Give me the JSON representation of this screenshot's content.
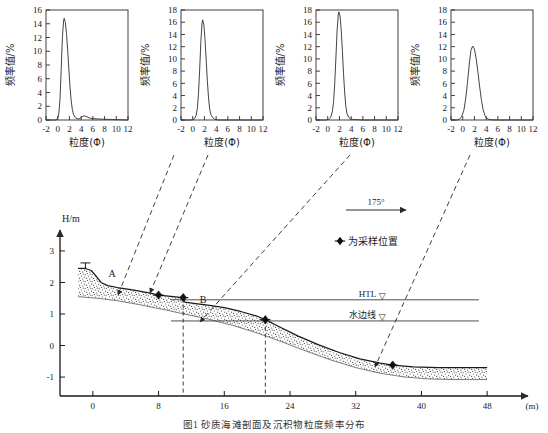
{
  "figure": {
    "caption": "图1  砂质海滩剖面及沉积物粒度频率分布",
    "profile": {
      "yaxis_label": "H/m",
      "xaxis_unit": "(m)",
      "y_ticks": [
        3,
        2,
        1,
        0,
        -1
      ],
      "x_ticks": [
        0,
        8,
        16,
        24,
        32,
        40,
        48
      ],
      "xlim": [
        -4,
        52
      ],
      "ylim": [
        -1.6,
        3.6
      ],
      "point_labels": [
        "A",
        "B"
      ],
      "wind_label": "175°",
      "legend_text": "为采样位置",
      "legend_marker": "diamond-marker",
      "htl_label": "HTL",
      "waterline_label": "水边线",
      "htl_level": 1.45,
      "waterline_level": 0.78,
      "sample_points": [
        {
          "x": 8.0,
          "y": 1.6
        },
        {
          "x": 11.0,
          "y": 1.52
        },
        {
          "x": 21.0,
          "y": 0.82
        },
        {
          "x": 36.5,
          "y": -0.62
        }
      ],
      "surface": [
        [
          -1.8,
          2.45
        ],
        [
          -1.0,
          2.45
        ],
        [
          -0.2,
          2.38
        ],
        [
          0.4,
          2.2
        ],
        [
          1.0,
          2.0
        ],
        [
          1.8,
          1.9
        ],
        [
          3.0,
          1.84
        ],
        [
          5.0,
          1.76
        ],
        [
          7.0,
          1.66
        ],
        [
          8.0,
          1.6
        ],
        [
          9.5,
          1.56
        ],
        [
          10.6,
          1.53
        ],
        [
          11.0,
          1.52
        ],
        [
          11.2,
          1.38
        ],
        [
          12.5,
          1.33
        ],
        [
          14.0,
          1.28
        ],
        [
          16.0,
          1.2
        ],
        [
          18.0,
          1.08
        ],
        [
          20.0,
          0.93
        ],
        [
          21.0,
          0.82
        ],
        [
          22.5,
          0.62
        ],
        [
          25.0,
          0.3
        ],
        [
          27.5,
          0.02
        ],
        [
          30.0,
          -0.22
        ],
        [
          32.5,
          -0.42
        ],
        [
          35.0,
          -0.56
        ],
        [
          36.5,
          -0.62
        ],
        [
          39.0,
          -0.68
        ],
        [
          42.0,
          -0.7
        ],
        [
          45.0,
          -0.7
        ],
        [
          48.0,
          -0.7
        ]
      ],
      "base": [
        [
          -1.8,
          1.55
        ],
        [
          0.5,
          1.5
        ],
        [
          3.0,
          1.42
        ],
        [
          6.0,
          1.28
        ],
        [
          9.0,
          1.12
        ],
        [
          11.5,
          0.98
        ],
        [
          14.0,
          0.84
        ],
        [
          17.0,
          0.64
        ],
        [
          20.0,
          0.4
        ],
        [
          23.0,
          0.12
        ],
        [
          26.0,
          -0.18
        ],
        [
          29.0,
          -0.46
        ],
        [
          32.0,
          -0.7
        ],
        [
          35.0,
          -0.88
        ],
        [
          38.0,
          -1.0
        ],
        [
          41.0,
          -1.06
        ],
        [
          44.0,
          -1.08
        ],
        [
          48.0,
          -1.08
        ]
      ],
      "leaders": [
        {
          "from": [
            174,
            155
          ],
          "to": [
            118,
            295
          ]
        },
        {
          "from": [
            208,
            155
          ],
          "to": [
            150,
            293
          ]
        },
        {
          "from": [
            350,
            155
          ],
          "to": [
            200,
            322
          ]
        },
        {
          "from": [
            470,
            155
          ],
          "to": [
            375,
            367
          ]
        }
      ]
    }
  },
  "chart_data": [
    {
      "type": "line",
      "index": 1,
      "title": "",
      "xlabel": "粒度(Φ)",
      "ylabel": "频率值/%",
      "xlim": [
        -2,
        12
      ],
      "ylim": [
        0,
        16
      ],
      "xticks": [
        -2,
        0,
        2,
        4,
        6,
        8,
        10,
        12
      ],
      "yticks": [
        0,
        2,
        4,
        6,
        8,
        10,
        12,
        14,
        16
      ],
      "peak_x": 1.1,
      "peak_y": 14.8,
      "grid": false,
      "x": [
        -2.0,
        -1.0,
        -0.4,
        0.0,
        0.2,
        0.4,
        0.6,
        0.8,
        1.0,
        1.1,
        1.3,
        1.5,
        1.7,
        1.9,
        2.1,
        2.3,
        2.5,
        2.7,
        3.0,
        3.3,
        3.6,
        4.0,
        4.3,
        4.6,
        5.0,
        5.4,
        6.0,
        7.0,
        8.0,
        9.0,
        10.0,
        11.0,
        12.0
      ],
      "y": [
        0.0,
        0.0,
        0.0,
        0.2,
        1.0,
        3.2,
        7.5,
        12.0,
        14.4,
        14.8,
        14.2,
        12.6,
        10.2,
        7.4,
        4.8,
        2.8,
        1.5,
        0.8,
        0.35,
        0.2,
        0.15,
        0.35,
        0.55,
        0.6,
        0.45,
        0.3,
        0.2,
        0.15,
        0.1,
        0.08,
        0.05,
        0.03,
        0.0
      ]
    },
    {
      "type": "line",
      "index": 2,
      "title": "",
      "xlabel": "粒度(Φ)",
      "ylabel": "频率值/%",
      "xlim": [
        -2,
        12
      ],
      "ylim": [
        0,
        18
      ],
      "xticks": [
        -2,
        0,
        2,
        4,
        6,
        8,
        10,
        12
      ],
      "yticks": [
        0,
        2,
        4,
        6,
        8,
        10,
        12,
        14,
        16,
        18
      ],
      "peak_x": 1.7,
      "peak_y": 16.4,
      "grid": false,
      "x": [
        -2.0,
        -0.5,
        0.0,
        0.3,
        0.6,
        0.8,
        1.0,
        1.2,
        1.4,
        1.6,
        1.7,
        1.9,
        2.1,
        2.3,
        2.5,
        2.7,
        2.9,
        3.1,
        3.4,
        3.7,
        4.0,
        4.5,
        5.0,
        6.0,
        8.0,
        10.0,
        12.0
      ],
      "y": [
        0.0,
        0.0,
        0.05,
        0.2,
        0.8,
        2.0,
        4.5,
        8.5,
        13.0,
        16.0,
        16.4,
        15.6,
        13.2,
        9.8,
        6.4,
        3.6,
        1.8,
        0.9,
        0.4,
        0.15,
        0.05,
        0.0,
        0.0,
        0.0,
        0.0,
        0.0,
        0.0
      ]
    },
    {
      "type": "line",
      "index": 3,
      "title": "",
      "xlabel": "粒度(Φ)",
      "ylabel": "频率值/%",
      "xlim": [
        -2,
        12
      ],
      "ylim": [
        0,
        18
      ],
      "xticks": [
        -2,
        0,
        2,
        4,
        6,
        8,
        10,
        12
      ],
      "yticks": [
        0,
        2,
        4,
        6,
        8,
        10,
        12,
        14,
        16,
        18
      ],
      "peak_x": 1.9,
      "peak_y": 17.7,
      "grid": false,
      "x": [
        -2.0,
        -0.4,
        0.2,
        0.5,
        0.8,
        1.0,
        1.2,
        1.4,
        1.6,
        1.8,
        1.9,
        2.1,
        2.3,
        2.5,
        2.7,
        2.9,
        3.1,
        3.3,
        3.6,
        3.9,
        4.2,
        4.6,
        5.2,
        6.0,
        8.0,
        10.0,
        12.0
      ],
      "y": [
        0.0,
        0.0,
        0.1,
        0.4,
        1.4,
        3.0,
        6.0,
        10.2,
        14.6,
        17.2,
        17.7,
        17.0,
        14.8,
        11.4,
        7.6,
        4.4,
        2.2,
        1.0,
        0.4,
        0.2,
        0.12,
        0.08,
        0.05,
        0.0,
        0.0,
        0.0,
        0.0
      ]
    },
    {
      "type": "line",
      "index": 4,
      "title": "",
      "xlabel": "粒度(Φ)",
      "ylabel": "频率值/%",
      "xlim": [
        -2,
        12
      ],
      "ylim": [
        0,
        18
      ],
      "xticks": [
        -2,
        0,
        2,
        4,
        6,
        8,
        10,
        12
      ],
      "yticks": [
        0,
        2,
        4,
        6,
        8,
        10,
        12,
        14,
        16,
        18
      ],
      "peak_x": 1.7,
      "peak_y": 12.1,
      "grid": false,
      "x": [
        -2.0,
        -1.0,
        -0.6,
        -0.2,
        0.2,
        0.5,
        0.8,
        1.1,
        1.4,
        1.7,
        2.0,
        2.3,
        2.6,
        2.9,
        3.2,
        3.5,
        3.8,
        4.1,
        4.5,
        5.0,
        6.0,
        8.0,
        10.0,
        12.0
      ],
      "y": [
        0.0,
        0.0,
        0.1,
        0.5,
        1.6,
        3.4,
        6.0,
        9.0,
        11.4,
        12.1,
        11.6,
        10.0,
        7.8,
        5.4,
        3.2,
        1.6,
        0.7,
        0.3,
        0.1,
        0.03,
        0.0,
        0.0,
        0.0,
        0.0
      ]
    }
  ]
}
